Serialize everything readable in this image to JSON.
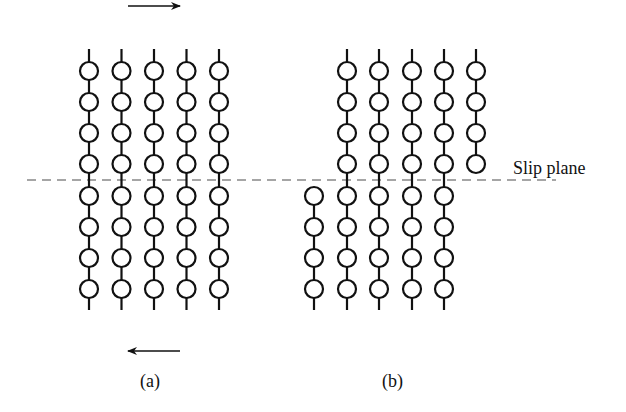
{
  "figure": {
    "slip_plane_label": "Slip plane",
    "panel_a_label": "(a)",
    "panel_b_label": "(b)",
    "top_arrow": {
      "direction": "right",
      "x1": 128,
      "x2": 180,
      "y": 6
    },
    "bottom_arrow": {
      "direction": "left",
      "x1": 180,
      "x2": 128,
      "y": 351
    },
    "slip_plane": {
      "x1": 27,
      "x2": 556,
      "y": 180,
      "color": "#888888"
    },
    "colors": {
      "stroke": "#111111",
      "dash": "#888888",
      "background": "#ffffff"
    },
    "atom_radius": 9,
    "panel_a": {
      "columns_x": [
        89,
        121.5,
        154,
        186.5,
        219
      ],
      "rows_y": [
        71,
        102,
        133,
        164,
        196,
        227,
        258,
        289
      ],
      "line_top": 49,
      "line_bottom": 310
    },
    "panel_b": {
      "upper_block": {
        "columns_x": [
          347,
          379,
          412,
          444,
          476
        ],
        "rows_y": [
          71,
          102,
          133,
          164
        ]
      },
      "lower_block": {
        "columns_x": [
          314,
          347,
          379,
          412,
          444
        ],
        "rows_y": [
          196,
          227,
          258,
          289
        ]
      },
      "line_top": 49,
      "line_bottom": 310
    }
  }
}
